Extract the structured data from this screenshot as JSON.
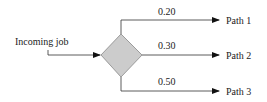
{
  "diagram": {
    "input": {
      "label": "Incoming job"
    },
    "decision": {
      "shape": "diamond",
      "fill": "#cccccc",
      "stroke": "#888888"
    },
    "branches": [
      {
        "probability": "0.20",
        "target": "Path 1"
      },
      {
        "probability": "0.30",
        "target": "Path 2"
      },
      {
        "probability": "0.50",
        "target": "Path 3"
      }
    ],
    "colors": {
      "line": "#333333",
      "arrow": "#111111",
      "text": "#222222"
    }
  }
}
